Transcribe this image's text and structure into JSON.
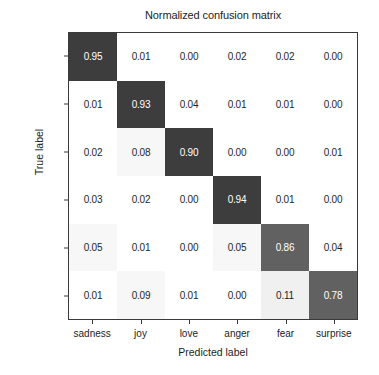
{
  "chart_data": {
    "type": "heatmap",
    "title": "Normalized confusion matrix",
    "xlabel": "Predicted label",
    "ylabel": "True label",
    "categories": [
      "sadness",
      "joy",
      "love",
      "anger",
      "fear",
      "surprise"
    ],
    "x_tick_labels": [
      "sadness",
      "joy",
      "love",
      "anger",
      "fear",
      "surprise"
    ],
    "y_tick_labels": [
      "sadness",
      "joy",
      "love",
      "anger",
      "fear",
      "surprise"
    ],
    "zlim": [
      0,
      1
    ],
    "grid": false,
    "legend": "none",
    "colormap": "grays_reversed",
    "values": [
      [
        0.95,
        0.01,
        0.0,
        0.02,
        0.02,
        0.0
      ],
      [
        0.01,
        0.93,
        0.04,
        0.01,
        0.01,
        0.0
      ],
      [
        0.02,
        0.08,
        0.9,
        0.0,
        0.0,
        0.01
      ],
      [
        0.03,
        0.02,
        0.0,
        0.94,
        0.01,
        0.0
      ],
      [
        0.05,
        0.01,
        0.0,
        0.05,
        0.86,
        0.04
      ],
      [
        0.01,
        0.09,
        0.01,
        0.0,
        0.11,
        0.78
      ]
    ],
    "cell_labels": [
      [
        "0.95",
        "0.01",
        "0.00",
        "0.02",
        "0.02",
        "0.00"
      ],
      [
        "0.01",
        "0.93",
        "0.04",
        "0.01",
        "0.01",
        "0.00"
      ],
      [
        "0.02",
        "0.08",
        "0.90",
        "0.00",
        "0.00",
        "0.01"
      ],
      [
        "0.03",
        "0.02",
        "0.00",
        "0.94",
        "0.01",
        "0.00"
      ],
      [
        "0.05",
        "0.01",
        "0.00",
        "0.05",
        "0.86",
        "0.04"
      ],
      [
        "0.01",
        "0.09",
        "0.01",
        "0.00",
        "0.11",
        "0.78"
      ]
    ],
    "colors": {
      "high_value_cell": "#3d3d3d",
      "mid_value_cell": "#616161",
      "low_value_cell": "#ffffff",
      "text_on_dark": "#ffffff",
      "text_on_light": "#262626",
      "axis": "#3a3a3a",
      "background": "#ffffff"
    }
  }
}
